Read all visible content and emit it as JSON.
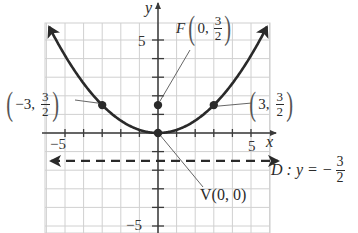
{
  "chart_data": {
    "type": "line",
    "title": "",
    "xlabel": "x",
    "ylabel": "y",
    "xlim": [
      -6,
      6
    ],
    "ylim": [
      -5.4,
      6
    ],
    "grid": true,
    "x_ticks": [
      -5,
      5
    ],
    "y_ticks": [
      5,
      -5
    ],
    "series": [
      {
        "name": "Parabola x^2 = 6y",
        "equation": "y = x^2/6",
        "x": [
          -6,
          -5,
          -4,
          -3,
          -2,
          -1,
          0,
          1,
          2,
          3,
          4,
          5,
          6
        ],
        "y": [
          6,
          4.17,
          2.67,
          1.5,
          0.67,
          0.17,
          0,
          0.17,
          0.67,
          1.5,
          2.67,
          4.17,
          6
        ]
      },
      {
        "name": "Directrix",
        "equation": "y = -3/2",
        "style": "dashed",
        "y": -1.5
      }
    ],
    "points": [
      {
        "name": "vertex",
        "x": 0,
        "y": 0,
        "label": "V(0, 0)"
      },
      {
        "name": "focus",
        "x": 0,
        "y": 1.5,
        "label": "F(0, 3/2)"
      },
      {
        "name": "left-point",
        "x": -3,
        "y": 1.5,
        "label": "(-3, 3/2)"
      },
      {
        "name": "right-point",
        "x": 3,
        "y": 1.5,
        "label": "(3, 3/2)"
      }
    ],
    "annotations": [
      "F(0, 3/2)",
      "(-3, 3/2)",
      "(3, 3/2)",
      "V(0, 0)",
      "D : y = -3/2"
    ]
  },
  "labels": {
    "x_axis": "x",
    "y_axis": "y",
    "tick_x_neg": "−5",
    "tick_x_pos": "5",
    "tick_y_pos": "5",
    "tick_y_neg": "−5",
    "focus_letter": "F",
    "focus_x": "0,",
    "left_x": "−3,",
    "right_x": "3,",
    "frac_num": "3",
    "frac_den": "2",
    "open_paren": "(",
    "close_paren": ")",
    "vertex": "V(0, 0)",
    "directrix_prefix": "D : y = −"
  },
  "colors": {
    "curve": "#2a2a2a",
    "grid": "#d0d0d0",
    "axis": "#3a3a3a"
  }
}
